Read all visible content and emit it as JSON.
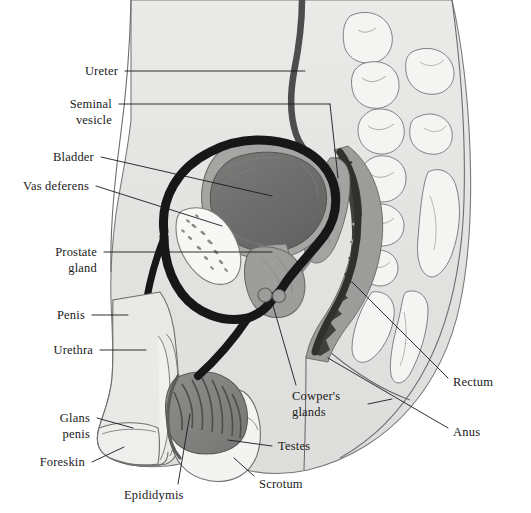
{
  "figure": {
    "background_color": "#ffffff",
    "line_color": "#1a1a1a",
    "body_fill": "#e3e3e1",
    "bone_fill": "#f2f2f0",
    "organ_mid_gray": "#9a9a98",
    "organ_dark_gray": "#6c6c6a",
    "rectum_dark": "#4a4a48",
    "duct_black": "#171717",
    "ureter_gray": "#4d4d4d"
  },
  "labels": {
    "ureter": "Ureter",
    "seminal_vesicle_line1": "Seminal",
    "seminal_vesicle_line2": "vesicle",
    "bladder": "Bladder",
    "vas_deferens": "Vas deferens",
    "prostate_line1": "Prostate",
    "prostate_line2": "gland",
    "penis": "Penis",
    "urethra": "Urethra",
    "glans_line1": "Glans",
    "glans_line2": "penis",
    "foreskin": "Foreskin",
    "epididymis": "Epididymis",
    "scrotum": "Scrotum",
    "testes": "Testes",
    "cowpers_line1": "Cowper's",
    "cowpers_line2": "glands",
    "anus": "Anus",
    "rectum": "Rectum"
  },
  "label_list": [
    {
      "key": "ureter",
      "text": "Ureter",
      "side": "left"
    },
    {
      "key": "seminal-vesicle",
      "text": "Seminal vesicle",
      "side": "left"
    },
    {
      "key": "bladder",
      "text": "Bladder",
      "side": "left"
    },
    {
      "key": "vas-deferens",
      "text": "Vas deferens",
      "side": "left"
    },
    {
      "key": "prostate-gland",
      "text": "Prostate gland",
      "side": "left"
    },
    {
      "key": "penis",
      "text": "Penis",
      "side": "left"
    },
    {
      "key": "urethra",
      "text": "Urethra",
      "side": "left"
    },
    {
      "key": "glans-penis",
      "text": "Glans penis",
      "side": "left"
    },
    {
      "key": "foreskin",
      "text": "Foreskin",
      "side": "left"
    },
    {
      "key": "epididymis",
      "text": "Epididymis",
      "side": "bottom"
    },
    {
      "key": "scrotum",
      "text": "Scrotum",
      "side": "bottom"
    },
    {
      "key": "testes",
      "text": "Testes",
      "side": "right"
    },
    {
      "key": "cowpers-glands",
      "text": "Cowper's glands",
      "side": "bottom"
    },
    {
      "key": "anus",
      "text": "Anus",
      "side": "right"
    },
    {
      "key": "rectum",
      "text": "Rectum",
      "side": "right"
    }
  ]
}
